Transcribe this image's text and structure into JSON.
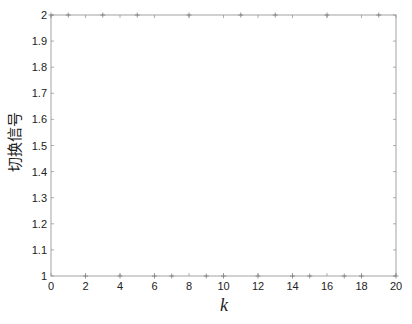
{
  "chart_data": {
    "type": "scatter",
    "title": "",
    "xlabel": "k",
    "ylabel": "切换信号",
    "xlim": [
      0,
      20
    ],
    "ylim": [
      1,
      2
    ],
    "xticks": [
      0,
      2,
      4,
      6,
      8,
      10,
      12,
      14,
      16,
      18,
      20
    ],
    "yticks": [
      1,
      1.1,
      1.2,
      1.3,
      1.4,
      1.5,
      1.6,
      1.7,
      1.8,
      1.9,
      2
    ],
    "ytick_labels": [
      "1",
      "1.1",
      "1.2",
      "1.3",
      "1.4",
      "1.5",
      "1.6",
      "1.7",
      "1.8",
      "1.9",
      "2"
    ],
    "grid": false,
    "legend": null,
    "marker": "+",
    "series": [
      {
        "name": "switching signal",
        "color": "#888888",
        "x": [
          0,
          1,
          2,
          3,
          4,
          5,
          6,
          7,
          8,
          9,
          10,
          11,
          12,
          13,
          14,
          15,
          16,
          17,
          18,
          19,
          20
        ],
        "values": [
          2,
          2,
          1,
          2,
          1,
          2,
          1,
          1,
          2,
          1,
          1,
          2,
          1,
          2,
          1,
          1,
          2,
          1,
          1,
          2,
          1
        ]
      }
    ]
  },
  "colors": {
    "axis": "#8c8c8c",
    "marker": "#7a7a7a",
    "text": "#222222"
  }
}
